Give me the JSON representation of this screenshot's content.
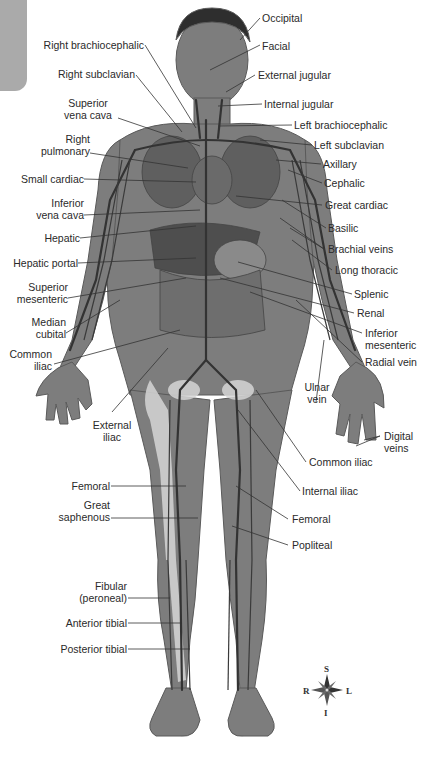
{
  "figure": {
    "labels_left": {
      "right_brachiocephalic": "Right brachiocephalic",
      "right_subclavian": "Right subclavian",
      "superior_vena_cava_1": "Superior",
      "superior_vena_cava_2": "vena cava",
      "right_pulmonary_1": "Right",
      "right_pulmonary_2": "pulmonary",
      "small_cardiac": "Small cardiac",
      "inferior_vena_cava_1": "Inferior",
      "inferior_vena_cava_2": "vena cava",
      "hepatic": "Hepatic",
      "hepatic_portal": "Hepatic portal",
      "superior_mesenteric_1": "Superior",
      "superior_mesenteric_2": "mesenteric",
      "median_cubital_1": "Median",
      "median_cubital_2": "cubital",
      "common_iliac_1": "Common",
      "common_iliac_2": "iliac",
      "external_iliac_1": "External",
      "external_iliac_2": "iliac",
      "femoral": "Femoral",
      "great_saphenous_1": "Great",
      "great_saphenous_2": "saphenous",
      "fibular_1": "Fibular",
      "fibular_2": "(peroneal)",
      "anterior_tibial": "Anterior tibial",
      "posterior_tibial": "Posterior tibial"
    },
    "labels_right": {
      "occipital": "Occipital",
      "facial": "Facial",
      "external_jugular": "External jugular",
      "internal_jugular": "Internal jugular",
      "left_brachiocephalic": "Left brachiocephalic",
      "left_subclavian": "Left subclavian",
      "axillary": "Axillary",
      "cephalic": "Cephalic",
      "great_cardiac": "Great cardiac",
      "basilic": "Basilic",
      "brachial_veins": "Brachial veins",
      "long_thoracic": "Long thoracic",
      "splenic": "Splenic",
      "renal": "Renal",
      "inferior_mesenteric_1": "Inferior",
      "inferior_mesenteric_2": "mesenteric",
      "radial_vein": "Radial vein",
      "ulnar_vein_1": "Ulnar",
      "ulnar_vein_2": "vein",
      "digital_veins_1": "Digital",
      "digital_veins_2": "veins",
      "common_iliac": "Common iliac",
      "internal_iliac": "Internal iliac",
      "femoral": "Femoral",
      "popliteal": "Popliteal"
    },
    "compass": {
      "top": "S",
      "bottom": "I",
      "left": "R",
      "right": "L"
    },
    "colors": {
      "skin": "#7a7a7a",
      "vein": "#3a3a3a",
      "organ": "#5c5c5c",
      "bone": "#d8d8d8",
      "tab": "#aaaaaa"
    }
  }
}
